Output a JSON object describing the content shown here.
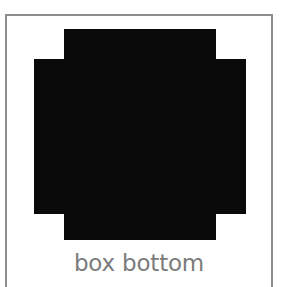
{
  "figure": {
    "caption": "box bottom",
    "caption_color": "#7b7b7b",
    "frame_color": "#8d8d8d",
    "background_color": "#ffffff",
    "shape": {
      "name": "box-bottom-cross-template",
      "fill_color": "#0a0a0a",
      "description": "plus / cross shaped solid silhouette",
      "path": "M 64,29 L 216,29 L 216,59 L 246,59 L 246,214 L 216,214 L 216,240 L 64,240 L 64,214 L 34,214 L 34,59 L 64,59 Z",
      "vertical_bar": {
        "x": 64,
        "y": 29,
        "width": 152,
        "height": 211
      },
      "horizontal_bar": {
        "x": 34,
        "y": 59,
        "width": 212,
        "height": 155
      }
    }
  }
}
